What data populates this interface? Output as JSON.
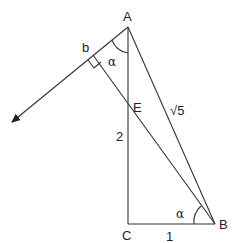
{
  "diagram": {
    "type": "geometry",
    "points": {
      "A": {
        "label": "A",
        "x": 128,
        "y": 27
      },
      "B": {
        "label": "B",
        "x": 215,
        "y": 224
      },
      "C": {
        "label": "C",
        "x": 128,
        "y": 224
      },
      "E": {
        "label": "E",
        "x": 128,
        "y": 108
      },
      "b": {
        "label": "b",
        "x": 93,
        "y": 52
      }
    },
    "segment_labels": {
      "AB": "√5",
      "EC": "2",
      "CB": "1"
    },
    "angle_labels": {
      "at_A": "α",
      "at_B": "α"
    },
    "arrow": {
      "from": "A",
      "direction": "down-left",
      "tip": {
        "x": 10,
        "y": 123
      }
    }
  }
}
